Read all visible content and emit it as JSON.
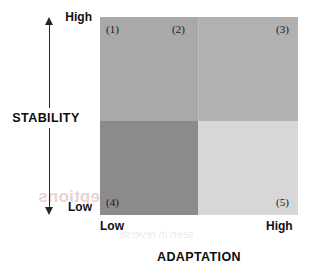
{
  "chart_data": {
    "type": "heatmap",
    "title": "",
    "xlabel": "ADAPTATION",
    "ylabel": "STABILITY",
    "grid": false,
    "legend": "none",
    "x_tick_labels": [
      "Low",
      "High"
    ],
    "y_tick_labels": [
      "Low",
      "High"
    ],
    "x_axis_arrow": "double",
    "y_axis_arrow": "double",
    "categories": [
      "Low",
      "High"
    ],
    "cells": [
      {
        "id": "1",
        "label": "(1)",
        "x": "Low",
        "y": "High",
        "color": "#a9a9a9",
        "position": "top-left"
      },
      {
        "id": "2",
        "label": "(2)",
        "x": "Low-High boundary",
        "y": "High",
        "color": "#a9a9a9",
        "position": "top-center"
      },
      {
        "id": "3",
        "label": "(3)",
        "x": "High",
        "y": "High",
        "color": "#b1b1b1",
        "position": "top-right"
      },
      {
        "id": "4",
        "label": "(4)",
        "x": "Low",
        "y": "Low",
        "color": "#8b8b8b",
        "position": "bottom-left"
      },
      {
        "id": "5",
        "label": "(5)",
        "x": "High",
        "y": "Low",
        "color": "#d7d7d7",
        "position": "bottom-right"
      }
    ]
  },
  "axes": {
    "y": {
      "title": "STABILITY",
      "high_label": "High",
      "low_label": "Low"
    },
    "x": {
      "title": "ADAPTATION",
      "low_label": "Low",
      "high_label": "High"
    }
  },
  "quadrant_labels": {
    "q1": "(1)",
    "q2": "(2)",
    "q3": "(3)",
    "q4": "(4)",
    "q5": "(5)"
  },
  "bleed_through": {
    "line1": "Changing as 0.9 perceptions",
    "line2": "seen in reverse"
  },
  "colors": {
    "top_left": "#a9a9a9",
    "top_right": "#b1b1b1",
    "bottom_left": "#8b8b8b",
    "bottom_right": "#d7d7d7",
    "axis": "#262626",
    "text": "#111111",
    "background": "#ffffff"
  }
}
